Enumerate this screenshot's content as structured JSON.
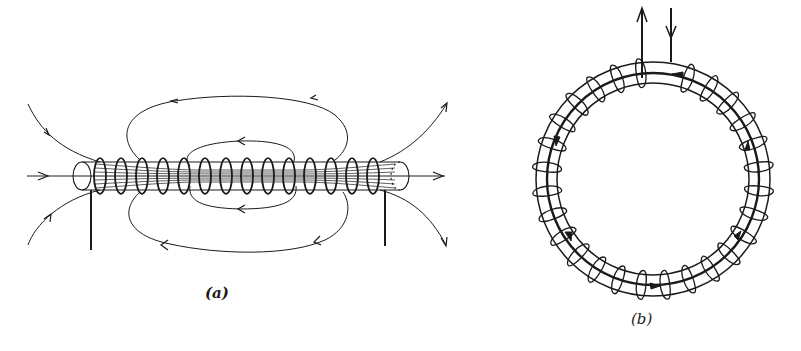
{
  "figure": {
    "panels": [
      {
        "id": "a",
        "label": "(a)",
        "subject": "solenoid",
        "description": "Straight solenoid wound on a cylindrical core with magnetic field lines: uniform lines inside, closing loops outside, arrows indicating direction.",
        "turns": 15
      },
      {
        "id": "b",
        "label": "(b)",
        "subject": "toroid",
        "description": "Toroidal coil wound on a ring core with lead wires at top (one arrow up, one arrow down) and circulating field arrows inside the core.",
        "turns": 28
      }
    ]
  },
  "colors": {
    "ink": "#1a1a1a",
    "background": "#ffffff"
  }
}
